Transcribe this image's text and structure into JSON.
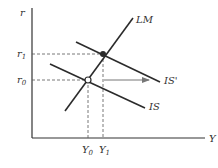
{
  "diagram": {
    "type": "IS-LM shift",
    "axes": {
      "y_label": "r",
      "x_label": "Y"
    },
    "levels": {
      "r0": {
        "base": "r",
        "sub": "0"
      },
      "r1": {
        "base": "r",
        "sub": "1"
      },
      "Y0": {
        "base": "Y",
        "sub": "0"
      },
      "Y1": {
        "base": "Y",
        "sub": "1"
      }
    },
    "curves": {
      "LM": "LM",
      "IS": "IS",
      "IS_prime": "IS'"
    },
    "points": [
      {
        "name": "initial-equilibrium",
        "style": "open"
      },
      {
        "name": "new-equilibrium",
        "style": "filled"
      }
    ],
    "colors": {
      "line": "#2b2b2b",
      "dash": "#555555",
      "arrow": "#777777"
    }
  }
}
